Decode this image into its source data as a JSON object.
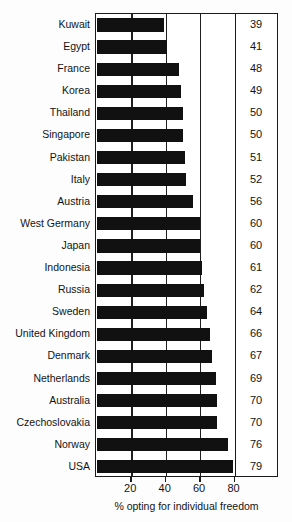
{
  "chart_data": {
    "type": "bar",
    "orientation": "horizontal",
    "title": "",
    "xlabel": "% opting for individual freedom",
    "ylabel": "",
    "xlim": [
      0,
      85
    ],
    "xticks": [
      20,
      40,
      60,
      80
    ],
    "xtick_labels": [
      "20",
      "40",
      "60",
      "80"
    ],
    "gridlines": [
      20,
      40,
      60,
      80
    ],
    "grid": true,
    "legend": null,
    "bar_color": "#111111",
    "value_labels_shown": true,
    "categories": [
      "Kuwait",
      "Egypt",
      "France",
      "Korea",
      "Thailand",
      "Singapore",
      "Pakistan",
      "Italy",
      "Austria",
      "West Germany",
      "Japan",
      "Indonesia",
      "Russia",
      "Sweden",
      "United Kingdom",
      "Denmark",
      "Netherlands",
      "Australia",
      "Czechoslovakia",
      "Norway",
      "USA"
    ],
    "values": [
      39,
      41,
      48,
      49,
      50,
      50,
      51,
      52,
      56,
      60,
      60,
      61,
      62,
      64,
      66,
      67,
      69,
      70,
      70,
      76,
      79
    ],
    "value_label_strings": [
      "39",
      "41",
      "48",
      "49",
      "50",
      "50",
      "51",
      "52",
      "56",
      "60",
      "60",
      "61",
      "62",
      "64",
      "66",
      "67",
      "69",
      "70",
      "70",
      "76",
      "79"
    ]
  },
  "axis": {
    "caption": "% opting for individual freedom"
  },
  "colors": {
    "bar": "#111111",
    "frame": "#1a1a1a",
    "grid": "#1f1f1f",
    "background": "#fdfdfd",
    "text": "#131313"
  }
}
